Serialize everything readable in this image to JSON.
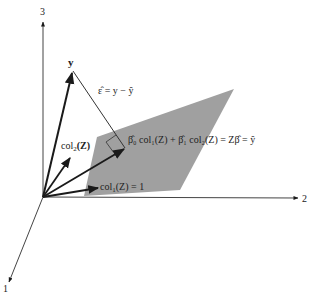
{
  "diagram": {
    "type": "geometry-3d-projection",
    "axes": {
      "axis1_label": "1",
      "axis2_label": "2",
      "axis3_label": "3"
    },
    "vectors": {
      "y_label": "y",
      "col2_label": "col",
      "col2_sub": "2",
      "col2_arg": "(Z)",
      "col1_label": "col",
      "col1_sub": "1",
      "col1_arg": "(Z) = 1"
    },
    "residual": {
      "label": "ε̂ = y − ŷ"
    },
    "fitted": {
      "label": "β̂₀ col₁(Z) + β̂₁ col₂(Z) = Zβ̂ = ŷ"
    },
    "colors": {
      "plane": "#a0a0a0",
      "ink": "#1a1a1a",
      "background": "#ffffff"
    }
  }
}
